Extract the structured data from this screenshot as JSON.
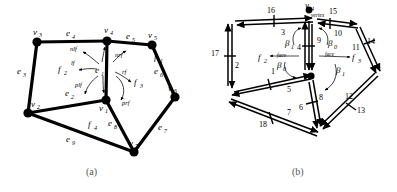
{
  "figure": {
    "captions": [
      {
        "id": "a",
        "text": "(a)"
      },
      {
        "id": "b",
        "text": "(b)"
      }
    ]
  },
  "panel_a": {
    "name": "mesh-topology-diagram",
    "vertices": [
      {
        "id": "v1",
        "label": "v",
        "sub": "1",
        "x": 106,
        "y": 100
      },
      {
        "id": "v2",
        "label": "v",
        "sub": "2",
        "x": 28,
        "y": 113
      },
      {
        "id": "v3",
        "label": "v",
        "sub": "3",
        "x": 37,
        "y": 42
      },
      {
        "id": "v4",
        "label": "v",
        "sub": "4",
        "x": 107,
        "y": 41
      },
      {
        "id": "v5",
        "label": "v",
        "sub": "5",
        "x": 152,
        "y": 45
      },
      {
        "id": "v6",
        "label": "v",
        "sub": "6",
        "x": 175,
        "y": 97
      },
      {
        "id": "v7",
        "label": "v",
        "sub": "7",
        "x": 134,
        "y": 152
      }
    ],
    "edges": [
      {
        "id": "e1",
        "label": "e",
        "sub": "1"
      },
      {
        "id": "e2",
        "label": "e",
        "sub": "2"
      },
      {
        "id": "e3",
        "label": "e",
        "sub": "3"
      },
      {
        "id": "e4",
        "label": "e",
        "sub": "4"
      },
      {
        "id": "e5",
        "label": "e",
        "sub": "5"
      },
      {
        "id": "e6",
        "label": "e",
        "sub": "6"
      },
      {
        "id": "e7",
        "label": "e",
        "sub": "7"
      },
      {
        "id": "e8",
        "label": "e",
        "sub": "8"
      },
      {
        "id": "e9",
        "label": "e",
        "sub": "9"
      }
    ],
    "faces": [
      {
        "id": "f1",
        "label": "f",
        "sub": "1"
      },
      {
        "id": "f2",
        "label": "f",
        "sub": "2"
      },
      {
        "id": "f3",
        "label": "f",
        "sub": "3"
      },
      {
        "id": "f4",
        "label": "f",
        "sub": "4"
      }
    ],
    "operators": [
      {
        "id": "nlf",
        "text": "nlf"
      },
      {
        "id": "nrf",
        "text": "nrf"
      },
      {
        "id": "lf",
        "text": "lf"
      },
      {
        "id": "rf",
        "text": "rf"
      },
      {
        "id": "plf",
        "text": "plf"
      },
      {
        "id": "prf",
        "text": "prf"
      }
    ]
  },
  "panel_b": {
    "name": "halfedge-orientation-diagram",
    "center_vertex": {
      "label": "v",
      "sub": "4"
    },
    "annotations": [
      {
        "id": "vertex-label",
        "text": "vertex"
      },
      {
        "id": "face-label-left",
        "text": "face"
      },
      {
        "id": "face-label-right",
        "text": "face"
      }
    ],
    "faces": [
      {
        "id": "f2",
        "label": "f",
        "sub": "2"
      },
      {
        "id": "f3",
        "label": "f",
        "sub": "3"
      }
    ],
    "betas": [
      {
        "id": "beta1-top-left",
        "label": "β",
        "sub": "1"
      },
      {
        "id": "beta0-top-right",
        "label": "β",
        "sub": "0"
      },
      {
        "id": "beta0-mid-left",
        "label": "β",
        "sub": "0"
      },
      {
        "id": "beta1-mid-right",
        "label": "β",
        "sub": "1"
      }
    ],
    "halfedge_numbers": [
      {
        "id": "he-1",
        "text": "1"
      },
      {
        "id": "he-2",
        "text": "2"
      },
      {
        "id": "he-3",
        "text": "3"
      },
      {
        "id": "he-4",
        "text": "4"
      },
      {
        "id": "he-5",
        "text": "5"
      },
      {
        "id": "he-6",
        "text": "6"
      },
      {
        "id": "he-7",
        "text": "7"
      },
      {
        "id": "he-8",
        "text": "8"
      },
      {
        "id": "he-9",
        "text": "9"
      },
      {
        "id": "he-10",
        "text": "10"
      },
      {
        "id": "he-11",
        "text": "11"
      },
      {
        "id": "he-12",
        "text": "12"
      },
      {
        "id": "he-13",
        "text": "13"
      },
      {
        "id": "he-14",
        "text": "14"
      },
      {
        "id": "he-15",
        "text": "15"
      },
      {
        "id": "he-16",
        "text": "16"
      },
      {
        "id": "he-17",
        "text": "17"
      },
      {
        "id": "he-18",
        "text": "18"
      }
    ]
  },
  "colors": {
    "ink": "#000000",
    "caption": "#555555",
    "background": "#ffffff"
  }
}
